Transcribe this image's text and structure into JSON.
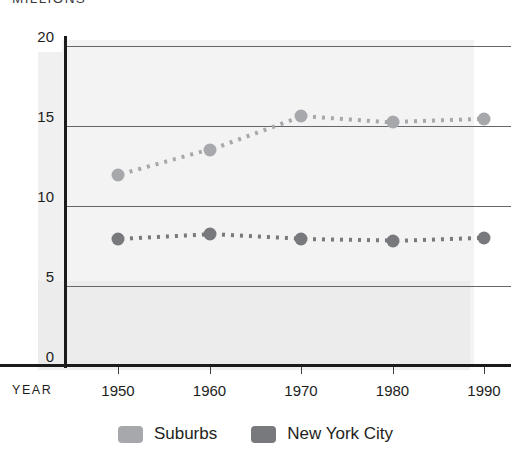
{
  "chart_data": {
    "type": "line",
    "title": "",
    "units_caption": "MILLIONS",
    "xlabel": "YEAR",
    "ylabel": "",
    "categories": [
      "1950",
      "1960",
      "1970",
      "1980",
      "1990"
    ],
    "x": [
      1950,
      1960,
      1970,
      1980,
      1990
    ],
    "xlim": [
      1945,
      1995
    ],
    "ylim": [
      0,
      20
    ],
    "yticks": [
      "0",
      "5",
      "10",
      "15",
      "20"
    ],
    "ytick_values": [
      0,
      5,
      10,
      15,
      20
    ],
    "grid": true,
    "grid_axis": "y",
    "legend_position": "bottom-center",
    "marker": "circle",
    "linestyle": "dotted",
    "series": [
      {
        "name": "Suburbs",
        "color": "#a6a8ab",
        "values": [
          11.9,
          13.5,
          15.6,
          15.2,
          15.4
        ]
      },
      {
        "name": "New York City",
        "color": "#77797c",
        "values": [
          7.9,
          8.2,
          7.9,
          7.8,
          8.0
        ]
      }
    ]
  },
  "legend": {
    "items": [
      {
        "label": "Suburbs",
        "color": "#a6a8ab"
      },
      {
        "label": "New York City",
        "color": "#77797c"
      }
    ]
  }
}
